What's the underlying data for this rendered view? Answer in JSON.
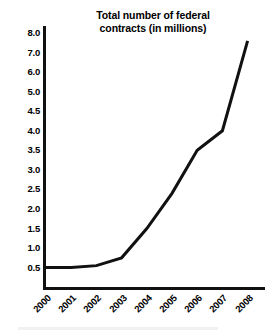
{
  "chart_data": {
    "type": "line",
    "title": "Total number of federal\ncontracts (in millions)",
    "title_line1": "Total number of federal",
    "title_line2": "contracts (in millions)",
    "xlabel": "",
    "ylabel": "",
    "categories": [
      "2000",
      "2001",
      "2002",
      "2003",
      "2004",
      "2005",
      "2006",
      "2007",
      "2008"
    ],
    "values": [
      0.5,
      0.5,
      0.55,
      0.75,
      1.5,
      2.4,
      3.5,
      4.0,
      7.6
    ],
    "series": [
      {
        "name": "Total number of federal contracts (in millions)",
        "values": [
          0.5,
          0.5,
          0.55,
          0.75,
          1.5,
          2.4,
          3.5,
          4.0,
          7.6
        ]
      }
    ],
    "ytick_labels": [
      "8.0",
      "7.0",
      "6.0",
      "5.0",
      "4.5",
      "4.0",
      "3.5",
      "3.0",
      "2.5",
      "2.0",
      "1.5",
      "1.0",
      "0.5"
    ],
    "ytick_values": [
      8.0,
      7.0,
      6.0,
      5.0,
      4.5,
      4.0,
      3.5,
      3.0,
      2.5,
      2.0,
      1.5,
      1.0,
      0.5
    ],
    "ytick_spacing_uniform": true,
    "ylim": [
      0.5,
      8.0
    ],
    "xlim": [
      "2000",
      "2008"
    ],
    "grid": false,
    "legend": false,
    "legend_position": "none",
    "line_color": "#111111",
    "line_width": 3,
    "axis_color": "#111111",
    "background_color": "#ffffff",
    "xtick_rotation": -45
  }
}
